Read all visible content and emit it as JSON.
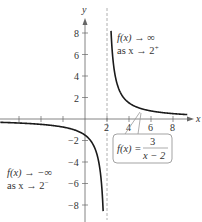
{
  "chart_data": {
    "type": "line",
    "title": "",
    "function": "f(x) = 3/(x - 2)",
    "xlabel": "x",
    "ylabel": "y",
    "xlim": [
      -7.7,
      10
    ],
    "ylim": [
      -9.7,
      10
    ],
    "x_ticks": [
      -6,
      -4,
      -2,
      2,
      4,
      6,
      8
    ],
    "x_tick_labels": [
      "2",
      "4",
      "6",
      "8"
    ],
    "y_ticks": [
      -8,
      -6,
      -4,
      -2,
      2,
      4,
      6,
      8
    ],
    "y_tick_labels": [
      "8",
      "6",
      "4",
      "2",
      "−2",
      "−4",
      "−6",
      "−8"
    ],
    "grid": false,
    "vertical_asymptote": 2,
    "horizontal_asymptote": 0,
    "series": [
      {
        "name": "f(x) = 3/(x − 2)",
        "x": [
          -7.5,
          -6,
          -4,
          -2,
          0,
          1,
          1.5,
          1.7,
          1.8,
          2.2,
          2.3,
          2.5,
          3,
          4,
          6,
          8,
          9.5
        ],
        "y": [
          -0.32,
          -0.375,
          -0.5,
          -0.75,
          -1.5,
          -3,
          -6,
          -10,
          -15,
          15,
          10,
          6,
          3,
          1.5,
          0.75,
          0.5,
          0.4
        ]
      }
    ],
    "annotations": [
      {
        "line1": "f(x) → ∞",
        "line2": "as x → 2⁺",
        "position": "upper right of asymptote"
      },
      {
        "line1": "f(x) → −∞",
        "line2": "as x → 2⁻",
        "position": "lower left"
      },
      {
        "label": "f(x) = 3 / (x − 2)",
        "boxed": true,
        "position": "below x-axis, right"
      }
    ]
  },
  "axes": {
    "x_label": "x",
    "y_label": "y",
    "x_tick_labels": [
      "2",
      "4",
      "6",
      "8"
    ],
    "y_pos_labels": [
      "8",
      "6",
      "4",
      "2"
    ],
    "y_neg_labels": [
      "−2",
      "−4",
      "−6",
      "−8"
    ]
  },
  "annotations": {
    "right_fx": "f(x) → ∞",
    "right_as": "as x → 2",
    "right_sup": "+",
    "left_fx": "f(x) → −∞",
    "left_as": "as x → 2",
    "left_sup": "−",
    "formula_lhs": "f(x) =",
    "formula_num": "3",
    "formula_den": "x − 2"
  },
  "colors": {
    "curve": "#1a1a1a",
    "axis": "#555555",
    "asymptote": "#aaaaaa",
    "label_box": "#999999"
  }
}
